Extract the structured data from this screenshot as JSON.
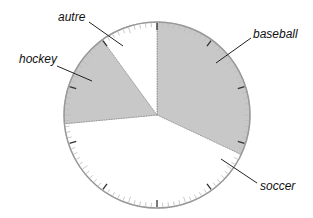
{
  "chart_data": {
    "type": "pie",
    "title": "",
    "categories": [
      "baseball",
      "soccer",
      "hockey",
      "autre"
    ],
    "values": [
      32,
      41.5,
      16.5,
      10
    ],
    "unit": "%",
    "start_angle_deg": 0,
    "direction": "clockwise",
    "legend": "none (direct leader-line labels)",
    "tick_marks": {
      "major_every_percent": 10,
      "minor_every_percent": 1
    },
    "slices": [
      {
        "label": "baseball",
        "value": 32,
        "fill": "#c8c8c8"
      },
      {
        "label": "soccer",
        "value": 41.5,
        "fill": "#ffffff"
      },
      {
        "label": "hockey",
        "value": 16.5,
        "fill": "#c8c8c8"
      },
      {
        "label": "autre",
        "value": 10,
        "fill": "#ffffff"
      }
    ]
  },
  "labels": {
    "baseball": "baseball",
    "soccer": "soccer",
    "hockey": "hockey",
    "autre": "autre"
  },
  "colors": {
    "shaded_fill": "#c8c8c8",
    "outline": "#999999",
    "major_tick": "#333333",
    "minor_tick": "#bbbbbb",
    "leader": "#222222"
  }
}
